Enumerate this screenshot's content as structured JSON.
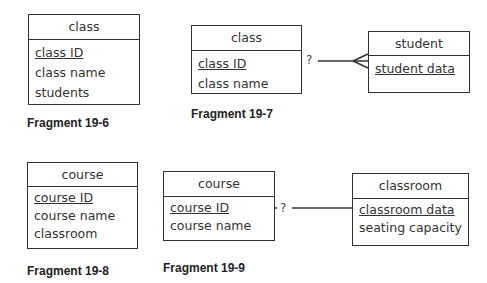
{
  "fragments": [
    {
      "caption": "Fragment 19-6",
      "entities": [
        {
          "name": "class",
          "attributes": [
            {
              "text": "class ID",
              "key": true
            },
            {
              "text": "class name"
            },
            {
              "text": "students"
            }
          ]
        }
      ]
    },
    {
      "caption": "Fragment 19-7",
      "entities": [
        {
          "name": "class",
          "attributes": [
            {
              "text": "class ID",
              "key": true
            },
            {
              "text": "class name"
            }
          ]
        },
        {
          "name": "student",
          "attributes": [
            {
              "text": "student data",
              "key": true
            }
          ]
        }
      ],
      "relationship": {
        "label": "?",
        "from": "class",
        "to": "student",
        "cardinality": "one-to-many"
      }
    },
    {
      "caption": "Fragment 19-8",
      "entities": [
        {
          "name": "course",
          "attributes": [
            {
              "text": "course ID",
              "key": true
            },
            {
              "text": "course name"
            },
            {
              "text": "classroom"
            }
          ]
        }
      ]
    },
    {
      "caption": "Fragment 19-9",
      "entities": [
        {
          "name": "course",
          "attributes": [
            {
              "text": "course ID",
              "key": true
            },
            {
              "text": "course name"
            }
          ]
        },
        {
          "name": "classroom",
          "attributes": [
            {
              "text": "classroom data",
              "key": true
            },
            {
              "text": "seating capacity"
            }
          ]
        }
      ],
      "relationship": {
        "label": "?",
        "from": "course",
        "to": "classroom",
        "cardinality": "one-to-one"
      }
    }
  ]
}
